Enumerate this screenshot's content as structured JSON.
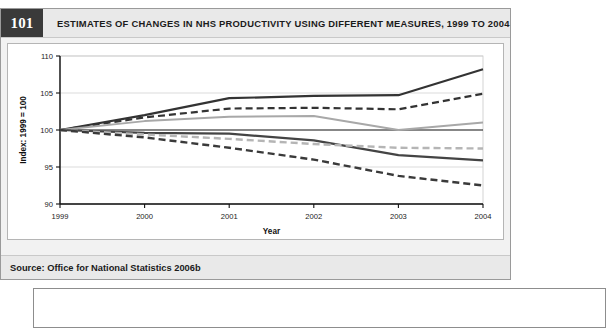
{
  "figure": {
    "number": "101",
    "title": "ESTIMATES OF CHANGES IN NHS PRODUCTIVITY USING DIFFERENT MEASURES, 1999 TO 2004",
    "source": "Source: Office for National Statistics 2006b"
  },
  "chart_data": {
    "type": "line",
    "title": "ESTIMATES OF CHANGES IN NHS PRODUCTIVITY USING DIFFERENT MEASURES, 1999 TO 2004",
    "xlabel": "Year",
    "ylabel": "Index: 1999 = 100",
    "x": [
      "1999",
      "2000",
      "2001",
      "2002",
      "2003",
      "2004"
    ],
    "categories": [
      "1999",
      "2000",
      "2001",
      "2002",
      "2003",
      "2004"
    ],
    "xticklabels": [
      "1999",
      "2000",
      "2001",
      "2002",
      "2003",
      "2004"
    ],
    "yticklabels": [
      "90",
      "95",
      "100",
      "105",
      "110"
    ],
    "ylim": [
      90,
      110
    ],
    "ytick_step": 5,
    "grid": true,
    "legend": "none",
    "reference_line": 100,
    "series": [
      {
        "name": "series-1-dark-solid-upper",
        "style": "solid",
        "color": "#333333",
        "width": 2.2,
        "values": [
          100,
          102.0,
          104.3,
          104.6,
          104.7,
          108.2
        ]
      },
      {
        "name": "series-2-dark-dashed-upper",
        "style": "dashed",
        "color": "#333333",
        "width": 2.2,
        "values": [
          100,
          101.7,
          102.9,
          103.0,
          102.8,
          104.9
        ]
      },
      {
        "name": "series-3-gray-solid-upper",
        "style": "solid",
        "color": "#a8a8a8",
        "width": 2.0,
        "values": [
          100,
          101.2,
          101.8,
          101.9,
          100.0,
          101.0
        ]
      },
      {
        "name": "series-4-dark-solid-lower",
        "style": "solid",
        "color": "#444444",
        "width": 2.2,
        "values": [
          100,
          99.6,
          99.5,
          98.6,
          96.6,
          95.9
        ]
      },
      {
        "name": "series-5-gray-dashed-lower",
        "style": "dashed",
        "color": "#b5b5b5",
        "width": 2.4,
        "values": [
          100,
          99.4,
          98.8,
          98.1,
          97.6,
          97.5
        ]
      },
      {
        "name": "series-6-dark-dashed-lower",
        "style": "dashed",
        "color": "#3a3a3a",
        "width": 2.4,
        "values": [
          100,
          99.0,
          97.6,
          96.0,
          93.8,
          92.5
        ]
      }
    ]
  }
}
